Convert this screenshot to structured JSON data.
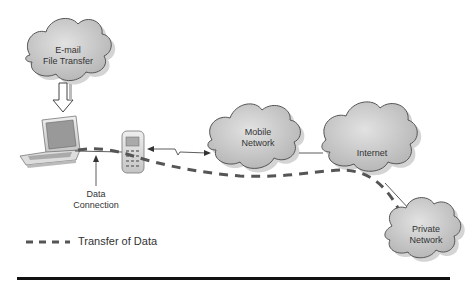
{
  "diagram": {
    "title": "",
    "nodes": [
      {
        "id": "email",
        "label_lines": [
          "E-mail",
          "File Transfer"
        ],
        "shape": "cloud"
      },
      {
        "id": "laptop",
        "label_lines": [],
        "shape": "laptop"
      },
      {
        "id": "phone",
        "label_lines": [],
        "shape": "mobile-phone"
      },
      {
        "id": "mobile",
        "label_lines": [
          "Mobile",
          "Network"
        ],
        "shape": "cloud"
      },
      {
        "id": "internet",
        "label_lines": [
          "Internet"
        ],
        "shape": "cloud"
      },
      {
        "id": "private",
        "label_lines": [
          "Private",
          "Network"
        ],
        "shape": "cloud"
      }
    ],
    "edges": [
      {
        "from": "email",
        "to": "laptop",
        "style": "hollow-arrow"
      },
      {
        "from": "laptop",
        "to": "phone",
        "style": "solid",
        "label": "Data Connection"
      },
      {
        "from": "phone",
        "to": "mobile",
        "style": "wireless-bidirectional"
      },
      {
        "from": "mobile",
        "to": "internet",
        "style": "solid"
      },
      {
        "from": "internet",
        "to": "private",
        "style": "solid"
      },
      {
        "from": "laptop",
        "to": "private",
        "style": "dashed",
        "meaning": "Transfer of Data"
      }
    ],
    "annotation": {
      "line1": "Data",
      "line2": "Connection"
    },
    "legend": {
      "label": "Transfer of Data",
      "style": "dashed"
    },
    "colors": {
      "cloud_fill": "#c8c8c8",
      "cloud_stroke": "#555555",
      "dash": "#555555",
      "line": "#333333"
    }
  },
  "labels": {
    "email_l1": "E-mail",
    "email_l2": "File Transfer",
    "mobile_l1": "Mobile",
    "mobile_l2": "Network",
    "internet": "Internet",
    "private_l1": "Private",
    "private_l2": "Network",
    "data_conn_l1": "Data",
    "data_conn_l2": "Connection",
    "legend": "Transfer of Data"
  }
}
